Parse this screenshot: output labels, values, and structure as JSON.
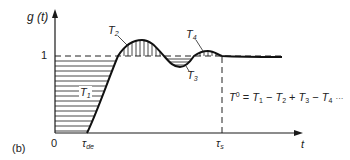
{
  "figure": {
    "panel_label": "(b)",
    "y_axis_label": "g (t)",
    "x_axis_label": "t",
    "y_tick_one": "1",
    "origin_label": "0",
    "tau_de": {
      "symbol": "τ",
      "sub": "de"
    },
    "tau_s": {
      "symbol": "τ",
      "sub": "s"
    },
    "areas": [
      {
        "name": "T",
        "sub": "1"
      },
      {
        "name": "T",
        "sub": "2"
      },
      {
        "name": "T",
        "sub": "3"
      },
      {
        "name": "T",
        "sub": "4"
      }
    ],
    "equation": {
      "lhs": "T",
      "lhs_sup": "0",
      "rhs": [
        {
          "op": "=",
          "term": "T",
          "sub": "1"
        },
        {
          "op": "−",
          "term": "T",
          "sub": "2"
        },
        {
          "op": "+",
          "term": "T",
          "sub": "3"
        },
        {
          "op": "−",
          "term": "T",
          "sub": "4"
        }
      ],
      "trailing": "···"
    },
    "colors": {
      "line": "#1a1a1a",
      "hatch": "#333333",
      "background": "#ffffff"
    }
  }
}
